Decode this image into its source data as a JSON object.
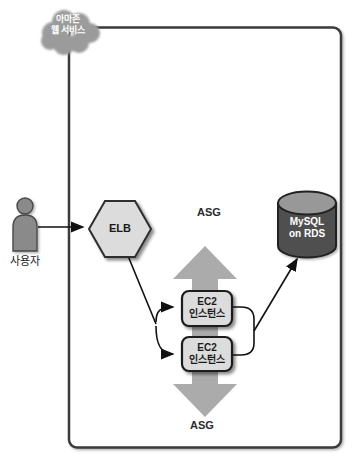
{
  "diagram": {
    "provider_cloud": {
      "label_line1": "아마존",
      "label_line2": "웹 서비스"
    },
    "user": {
      "label": "사용자"
    },
    "elb": {
      "label": "ELB"
    },
    "asg": {
      "top_label": "ASG",
      "bottom_label": "ASG"
    },
    "ec2_instances": [
      {
        "label_line1": "EC2",
        "label_line2": "인스턴스"
      },
      {
        "label_line1": "EC2",
        "label_line2": "인스턴스"
      }
    ],
    "database": {
      "label_line1": "MySQL",
      "label_line2": "on RDS"
    },
    "colors": {
      "background": "#ffffff",
      "boundary_border": "#3a3a3a",
      "cloud_fill": "#9b9b9b",
      "node_fill": "#dcdcdc",
      "node_border": "#1f1f1f",
      "scale_arrow_fill": "#ababab",
      "cylinder_body": "#4f4f4f",
      "cylinder_top": "#989898",
      "connector": "#111111",
      "person_fill": "#8a8a8a",
      "label_dark": "#1a1a1a",
      "label_light": "#ffffff"
    }
  }
}
